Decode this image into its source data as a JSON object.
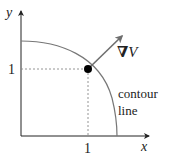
{
  "diagram": {
    "axes": {
      "x_label": "x",
      "y_label": "y",
      "x_tick_label": "1",
      "y_tick_label": "1"
    },
    "gradient_label_symbol": "∇",
    "gradient_label_var": "V",
    "contour_label_line1": "contour",
    "contour_label_line2": "line",
    "colors": {
      "axis": "#222222",
      "curve": "#777777",
      "arrow": "#6e6e6e",
      "point": "#000000",
      "dotted": "#888888"
    }
  }
}
